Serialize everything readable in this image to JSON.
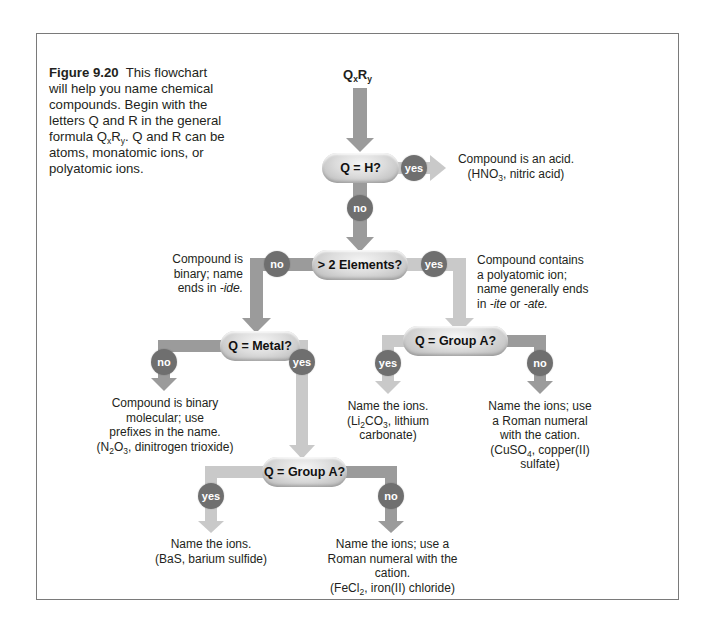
{
  "caption": {
    "figure_label": "Figure 9.20",
    "text": "This flowchart will help you name chemical compounds. Begin with the letters Q and R in the general formula QxRy. Q and R can be atoms, monatomic ions, or polyatomic ions."
  },
  "start_formula": {
    "q": "Q",
    "x": "x",
    "r": "R",
    "y": "y"
  },
  "nodes": {
    "q_h": "Q = H?",
    "elements": "> 2 Elements?",
    "metal": "Q = Metal?",
    "group_a_poly": "Q = Group A?",
    "group_a_metal": "Q = Group A?"
  },
  "branch_labels": {
    "yes": "yes",
    "no": "no"
  },
  "outcomes": {
    "acid": {
      "line1": "Compound is an acid.",
      "example_prefix": "(HNO",
      "example_sub": "3",
      "example_suffix": ", nitric acid)"
    },
    "binary": {
      "line1": "Compound is",
      "line2": "binary; name",
      "line3": "ends in ",
      "suffix_italic": "-ide."
    },
    "polyatomic": {
      "line1": "Compound contains",
      "line2": "a polyatomic ion;",
      "line3": "name generally ends",
      "line4_prefix": "in ",
      "italic1": "-ite",
      "mid": " or ",
      "italic2": "-ate."
    },
    "molecular": {
      "line1": "Compound is binary",
      "line2": "molecular; use",
      "line3": "prefixes in the name.",
      "ex_prefix": "(N",
      "ex_sub1": "2",
      "ex_mid": "O",
      "ex_sub2": "3",
      "ex_suffix": ", dinitrogen trioxide)"
    },
    "poly_group_a": {
      "line1": "Name the ions.",
      "ex_prefix": "(Li",
      "ex_sub1": "2",
      "ex_mid": "CO",
      "ex_sub2": "3",
      "ex_suffix": ", lithium",
      "line3": "carbonate)"
    },
    "poly_not_group_a": {
      "line1": "Name the ions; use",
      "line2": "a Roman numeral",
      "line3": "with the cation.",
      "ex_prefix": "(CuSO",
      "ex_sub": "4",
      "ex_suffix": ", copper(II) sulfate)"
    },
    "metal_group_a": {
      "line1": "Name the ions.",
      "line2": "(BaS, barium sulfide)"
    },
    "metal_not_group_a": {
      "line1": "Name the ions; use a",
      "line2": "Roman numeral with the cation.",
      "ex_prefix": "(FeCl",
      "ex_sub": "2",
      "ex_suffix": ", iron(II) chloride)"
    }
  },
  "colors": {
    "no_path": "#9b9b9b",
    "yes_path": "#c9c9c9",
    "circle": "#6f6f6f",
    "frame_border": "#7a7a7a"
  }
}
